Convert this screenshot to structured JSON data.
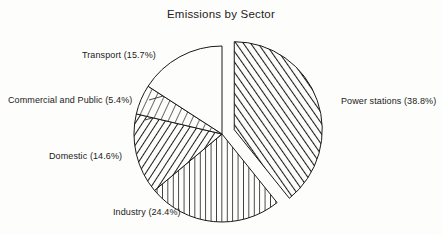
{
  "chart_data": {
    "type": "pie",
    "title": "Emissions by Sector",
    "xlabel": "",
    "ylabel": "",
    "legend": "none",
    "grid": false,
    "start_angle_deg": 0,
    "direction": "clockwise",
    "categories": [
      "Power stations",
      "Industry",
      "Domestic",
      "Commercial and Public",
      "Transport"
    ],
    "values": [
      38.8,
      24.4,
      14.6,
      5.4,
      15.7
    ],
    "units": "percent",
    "slices": [
      {
        "name": "Power stations",
        "value": 38.8,
        "label": "Power stations (38.8%)",
        "percent_text": "(38.8%)",
        "fill": "diagonal-forward-hatch",
        "exploded": true,
        "label_position": "right"
      },
      {
        "name": "Industry",
        "value": 24.4,
        "label": "Industry (24.4%)",
        "percent_text": "(24.4%)",
        "fill": "vertical-hatch",
        "exploded": false,
        "label_position": "bottom-left"
      },
      {
        "name": "Domestic",
        "value": 14.6,
        "label": "Domestic (14.6%)",
        "percent_text": "(14.6%)",
        "fill": "diagonal-back-hatch",
        "exploded": false,
        "label_position": "left"
      },
      {
        "name": "Commercial and Public",
        "value": 5.4,
        "label": "Commercial and Public (5.4%)",
        "percent_text": "(5.4%)",
        "fill": "sparse-diagonal-hatch",
        "exploded": false,
        "label_position": "left"
      },
      {
        "name": "Transport",
        "value": 15.7,
        "label": "Transport (15.7%)",
        "percent_text": "(15.7%)",
        "fill": "none",
        "exploded": false,
        "label_position": "top-left"
      }
    ]
  },
  "colors": {
    "background": "#fdfdfb",
    "ink": "#1a1a1a",
    "title": "#232323"
  }
}
